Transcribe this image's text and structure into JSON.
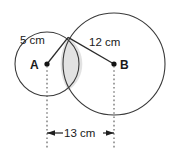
{
  "figure": {
    "type": "geometry-diagram",
    "background_color": "#ffffff",
    "stroke_color": "#3a3a3a",
    "shade_color": "#e2e2e2",
    "labels": {
      "radius_a": "5 cm",
      "radius_b": "12 cm",
      "center_a": "A",
      "center_b": "B",
      "distance_ab": "13 cm"
    },
    "circles": [
      {
        "name": "circle-a",
        "center_label": "A",
        "radius_label": "5 cm",
        "cx": 47,
        "cy": 64,
        "r": 32
      },
      {
        "name": "circle-b",
        "center_label": "B",
        "radius_label": "12 cm",
        "cx": 114,
        "cy": 64,
        "r": 51
      }
    ],
    "dimension": {
      "label": "13 cm",
      "from": "A",
      "to": "B"
    }
  }
}
